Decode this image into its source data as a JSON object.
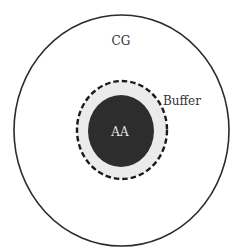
{
  "diagram": {
    "type": "nested-zones",
    "zones": {
      "outer": {
        "label": "CG",
        "center": [
          121.5,
          130.5
        ],
        "rx": 107.5,
        "ry": 115.5,
        "stroke": "#2b2b2b",
        "fill": "#ffffff",
        "line_style": "solid"
      },
      "buffer": {
        "label": "Buffer",
        "center": [
          122,
          130
        ],
        "rx": 45,
        "ry": 49,
        "stroke": "#1a1a1a",
        "fill": "#ebebeb",
        "line_style": "dashed"
      },
      "core": {
        "label": "AA",
        "center": [
          121,
          131
        ],
        "rx": 33,
        "ry": 36,
        "fill": "#2d2d2d",
        "label_color": "#e6e6e6"
      }
    },
    "text_color": "#333333"
  }
}
